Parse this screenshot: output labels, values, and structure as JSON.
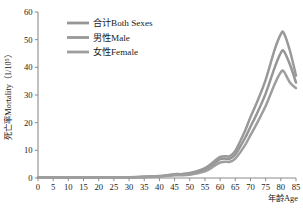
{
  "chart_data": {
    "type": "line",
    "title": "",
    "subtitle": "",
    "xlabel": "年龄Age",
    "ylabel": "死亡率Mortality（1/10⁵）",
    "xlim": [
      0,
      85
    ],
    "ylim": [
      0,
      60
    ],
    "x_ticks": [
      0,
      5,
      10,
      15,
      20,
      25,
      30,
      35,
      40,
      45,
      50,
      55,
      60,
      65,
      70,
      75,
      80,
      85
    ],
    "y_ticks": [
      0,
      10,
      20,
      30,
      40,
      50,
      60
    ],
    "grid": false,
    "legend_position": "top-left-inside",
    "x": [
      0,
      5,
      10,
      15,
      20,
      25,
      30,
      35,
      40,
      45,
      47,
      50,
      55,
      58,
      60,
      62,
      63,
      65,
      68,
      70,
      72,
      75,
      78,
      80,
      81,
      83,
      85
    ],
    "series": [
      {
        "name": "合计Both Sexes",
        "color": "#969696",
        "values": [
          0.3,
          0.2,
          0.2,
          0.2,
          0.2,
          0.3,
          0.3,
          0.4,
          0.6,
          1.2,
          1.2,
          1.5,
          3.0,
          5.2,
          6.8,
          7.0,
          6.9,
          8.5,
          14.0,
          18.5,
          23.0,
          30.5,
          40.0,
          45.2,
          45.8,
          41.0,
          34.5
        ]
      },
      {
        "name": "男性Male",
        "color": "#999999",
        "values": [
          0.3,
          0.2,
          0.2,
          0.2,
          0.2,
          0.3,
          0.3,
          0.5,
          0.7,
          1.4,
          1.4,
          1.8,
          3.6,
          6.0,
          7.6,
          7.9,
          7.8,
          9.8,
          16.5,
          22.0,
          27.0,
          35.5,
          46.5,
          52.0,
          52.4,
          46.0,
          37.0
        ]
      },
      {
        "name": "女性Female",
        "color": "#9e9e9e",
        "values": [
          0.3,
          0.2,
          0.2,
          0.2,
          0.2,
          0.2,
          0.3,
          0.3,
          0.5,
          1.0,
          1.0,
          1.2,
          2.4,
          4.3,
          5.6,
          5.9,
          5.8,
          7.0,
          11.5,
          15.5,
          19.5,
          26.0,
          34.0,
          38.2,
          38.5,
          34.5,
          32.5
        ]
      }
    ]
  },
  "legend": {
    "items": [
      {
        "label": "合计Both Sexes"
      },
      {
        "label": "男性Male"
      },
      {
        "label": "女性Female"
      }
    ]
  },
  "axes": {
    "x_title": "年龄Age",
    "y_title": "死亡率Mortality（1/10⁵）"
  }
}
